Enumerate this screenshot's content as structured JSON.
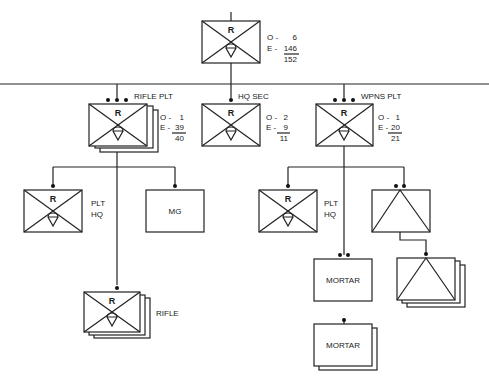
{
  "company": {
    "symbol_letter": "R",
    "o_label": "O -",
    "o_value": "6",
    "e_label": "E -",
    "e_value": "146",
    "total": "152"
  },
  "rifle_plt": {
    "name": "RIFLE PLT",
    "symbol_letter": "R",
    "o_label": "O -",
    "o_value": "1",
    "e_label": "E -",
    "e_value": "39",
    "total": "40"
  },
  "hq_sec": {
    "name": "HQ SEC",
    "symbol_letter": "R",
    "o_label": "O -",
    "o_value": "2",
    "e_label": "E -",
    "e_value": "9",
    "total": "11"
  },
  "wpns_plt": {
    "name": "WPNS PLT",
    "symbol_letter": "R",
    "o_label": "O -",
    "o_value": "1",
    "e_label": "E -",
    "e_value": "20",
    "total": "21"
  },
  "rifle_plt_hq": {
    "symbol_letter": "R",
    "name_line1": "PLT",
    "name_line2": "HQ"
  },
  "mg": {
    "name": "MG"
  },
  "rifle_squad": {
    "symbol_letter": "R",
    "name": "RIFLE"
  },
  "wpns_plt_hq": {
    "symbol_letter": "R",
    "name_line1": "PLT",
    "name_line2": "HQ"
  },
  "mortar_sec": {
    "name": "MORTAR"
  },
  "mortar_squad": {
    "name": "MORTAR"
  }
}
